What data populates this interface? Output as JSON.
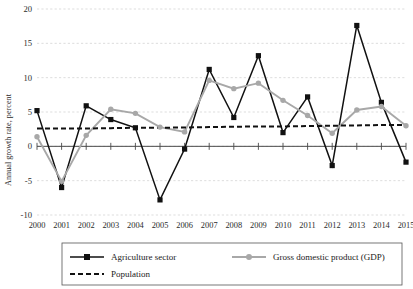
{
  "chart_data": {
    "type": "line",
    "title": "",
    "xlabel": "",
    "ylabel": "Annual growth rate, percent",
    "categories": [
      "2000",
      "2001",
      "2002",
      "2003",
      "2004",
      "2005",
      "2006",
      "2007",
      "2008",
      "2009",
      "2010",
      "2011",
      "2012",
      "2013",
      "2014",
      "2015"
    ],
    "ylim": [
      -10,
      20
    ],
    "yticks": [
      -10,
      -5,
      0,
      5,
      10,
      15,
      20
    ],
    "ytick_labels": [
      "-10",
      "-5",
      "0",
      "5",
      "10",
      "15",
      "20"
    ],
    "grid": true,
    "legend_position": "bottom",
    "series": [
      {
        "name": "Agriculture sector",
        "color": "#111111",
        "marker": "square",
        "style": "solid",
        "values": [
          5.2,
          -6.0,
          5.9,
          3.9,
          2.7,
          -7.8,
          -0.4,
          11.2,
          4.2,
          13.2,
          2.0,
          7.2,
          -2.8,
          17.6,
          6.4,
          -2.3
        ]
      },
      {
        "name": "Gross domestic product (GDP)",
        "color": "#a8a8a8",
        "marker": "circle",
        "style": "solid",
        "values": [
          1.4,
          -5.1,
          1.6,
          5.4,
          4.8,
          2.8,
          2.1,
          9.6,
          8.4,
          9.2,
          6.7,
          4.5,
          1.9,
          5.3,
          5.8,
          3.0
        ]
      },
      {
        "name": "Population",
        "color": "#111111",
        "marker": "none",
        "style": "dashed",
        "values": [
          2.6,
          2.6,
          2.6,
          2.65,
          2.7,
          2.7,
          2.75,
          2.8,
          2.85,
          2.9,
          2.9,
          2.95,
          3.0,
          3.05,
          3.1,
          3.1
        ]
      }
    ]
  },
  "legend": {
    "items": [
      {
        "label": "Agriculture sector"
      },
      {
        "label": "Gross domestic product (GDP)"
      },
      {
        "label": "Population"
      }
    ]
  },
  "axis": {
    "y_title": "Annual growth rate, percent"
  }
}
